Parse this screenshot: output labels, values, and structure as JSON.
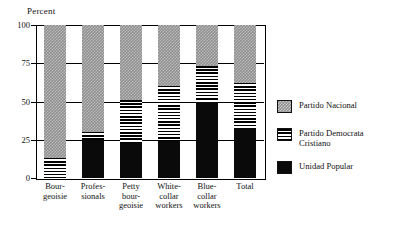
{
  "chart_data": {
    "type": "bar",
    "stacked": true,
    "title": "",
    "xlabel": "",
    "ylabel": "Percent",
    "ylim": [
      0,
      100
    ],
    "yticks": [
      0,
      25,
      50,
      75,
      100
    ],
    "ytick_labels": [
      "0",
      "25",
      "50",
      "75",
      "100"
    ],
    "grid": true,
    "legend_position": "right",
    "categories": [
      "Bour-\ngeoisie",
      "Profes-\nsionals",
      "Petty\nbour-\ngeoisie",
      "White-\ncollar\nworkers",
      "Blue-\ncollar\nworkers",
      "Total"
    ],
    "category_labels": [
      [
        "Bour-",
        "geoisie"
      ],
      [
        "Profes-",
        "sionals"
      ],
      [
        "Petty",
        "bour-",
        "geoisie"
      ],
      [
        "White-",
        "collar",
        "workers"
      ],
      [
        "Blue-",
        "collar",
        "workers"
      ],
      [
        "Total"
      ]
    ],
    "series": [
      {
        "name": "Unidad Popular",
        "key": "up",
        "color": "#0a0a0a",
        "pattern": "solid-black",
        "values": [
          0,
          25,
          23,
          24,
          50,
          33
        ]
      },
      {
        "name": "Partido Democrata Cristiano",
        "key": "pdc",
        "color": "#000000",
        "pattern": "horizontal-stripes",
        "values": [
          13,
          5,
          28,
          36,
          23,
          29
        ]
      },
      {
        "name": "Partido Nacional",
        "key": "nac",
        "color": "#8f8f8f",
        "pattern": "checker-dither",
        "values": [
          87,
          70,
          49,
          40,
          27,
          38
        ]
      }
    ],
    "legend_entries": [
      {
        "label": "Partido Nacional",
        "lines": [
          "Partido Nacional"
        ],
        "key": "nac"
      },
      {
        "label": "Partido Democrata Cristiano",
        "lines": [
          "Partido Democrata",
          "Cristiano"
        ],
        "key": "pdc"
      },
      {
        "label": "Unidad Popular",
        "lines": [
          "Unidad Popular"
        ],
        "key": "up"
      }
    ]
  }
}
